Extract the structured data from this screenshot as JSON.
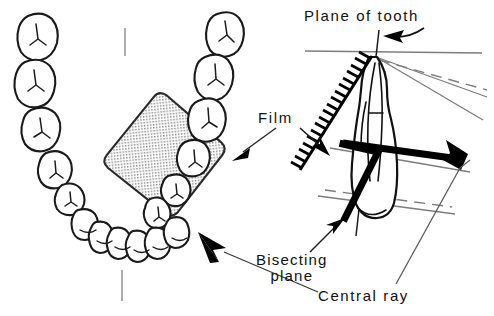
{
  "figure": {
    "background_color": "#ffffff",
    "width": 494,
    "height": 316,
    "ink_color": "#000000",
    "construction_line_color": "#7d7d7d"
  },
  "labels": {
    "plane_of_tooth": "Plane of tooth",
    "film": "Film",
    "bisecting_plane_line1": "Bisecting",
    "bisecting_plane_line2": "plane",
    "central_ray": "Central ray"
  },
  "panels": {
    "left": {
      "name": "occlusal-arch-view",
      "description": "Dental arch seen from above with radiographic film packet placed across the posterior teeth",
      "film_fill": "#d8d8d8"
    },
    "right": {
      "name": "bisecting-angle-cross-section",
      "description": "Longitudinal section of an anterior tooth showing film, bisecting plane and central ray"
    }
  },
  "elements": {
    "tooth_outline": "anterior incisor longitudinal section",
    "film_packet_edge_on": "serrated hatched band",
    "central_ray_bar": "thick black bar with arrowhead",
    "bisecting_plane_bar": "thick black diagonal bar",
    "apex_point": "converging point of planes"
  }
}
